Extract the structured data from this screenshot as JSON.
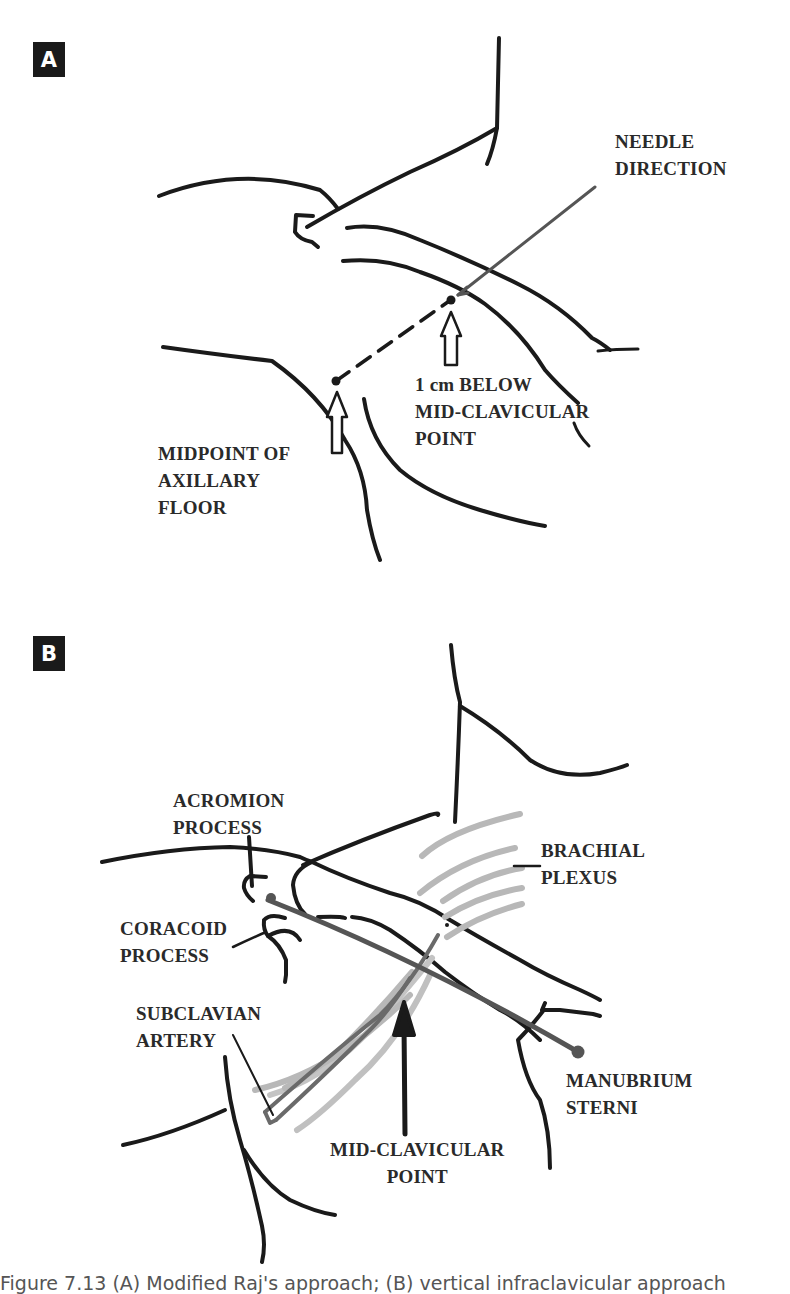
{
  "panels": {
    "a": {
      "badge": "A",
      "labels": {
        "needle_direction": "NEEDLE\nDIRECTION",
        "below_midclavicular": "1 cm BELOW\nMID-CLAVICULAR\nPOINT",
        "axillary_floor": "MIDPOINT OF\nAXILLARY\nFLOOR"
      }
    },
    "b": {
      "badge": "B",
      "labels": {
        "acromion": "ACROMION\nPROCESS",
        "coracoid": "CORACOID\nPROCESS",
        "brachial_plexus": "BRACHIAL\nPLEXUS",
        "subclavian_artery": "SUBCLAVIAN\nARTERY",
        "manubrium": "MANUBRIUM\nSTERNI",
        "midclavicular": "MID-CLAVICULAR\nPOINT"
      }
    }
  },
  "caption": "Figure 7.13 (A) Modified Raj's approach; (B) vertical infraclavicular approach",
  "colors": {
    "ink": "#1a1a1a",
    "needle": "#555555",
    "plexus": "#b8b8b8",
    "artery": "#6a6a6a"
  }
}
